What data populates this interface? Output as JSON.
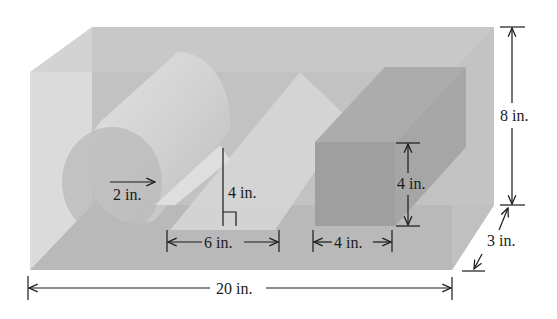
{
  "figure": {
    "type": "3D box containing solids",
    "colors": {
      "box_front": "#bdbdbd",
      "box_top": "#d2d2d2",
      "box_side": "#c4c4c4",
      "cylinder": "#c9c9c9",
      "cylinder_end": "#bcbcbc",
      "prism": "#d0d0d0",
      "cube_front": "#9e9e9e",
      "cube_top": "#ababab",
      "cube_side": "#a4a4a4",
      "floor": "#b2b2b2",
      "ink": "#1a1a1a"
    },
    "labels": {
      "box_height": "8 in.",
      "box_depth": "3 in.",
      "box_length": "20 in.",
      "cylinder_radius": "2 in.",
      "prism_height": "4 in.",
      "prism_base": "6 in.",
      "cube_height": "4 in.",
      "cube_width": "4 in."
    }
  }
}
